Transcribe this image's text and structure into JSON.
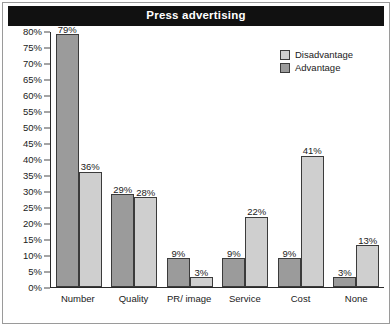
{
  "title": "Press advertising",
  "colors": {
    "advantage": "#9b9b9b",
    "disadvantage": "#cfcfcf",
    "title_bar_bg": "#111111",
    "title_text": "#ffffff",
    "axis": "#2a2a2a"
  },
  "legend": {
    "position": "top-right",
    "items": [
      {
        "label": "Disadvantage",
        "swatch": "disadvantage"
      },
      {
        "label": "Advantage",
        "swatch": "advantage"
      }
    ]
  },
  "axis": {
    "y_ticks": [
      "80%",
      "75%",
      "70%",
      "65%",
      "60%",
      "55%",
      "50%",
      "45%",
      "40%",
      "35%",
      "30%",
      "25%",
      "20%",
      "15%",
      "10%",
      "5%",
      "0%"
    ]
  },
  "chart_data": {
    "type": "bar",
    "title": "Press advertising",
    "xlabel": "",
    "ylabel": "",
    "ylim": [
      0,
      80
    ],
    "ytick_step": 5,
    "grid": false,
    "legend_position": "top-right",
    "categories": [
      "Number",
      "Quality",
      "PR/ image",
      "Service",
      "Cost",
      "None"
    ],
    "series": [
      {
        "name": "Advantage",
        "values": [
          79,
          29,
          9,
          9,
          9,
          3
        ],
        "labels": [
          "79%",
          "29%",
          "9%",
          "9%",
          "9%",
          "3%"
        ]
      },
      {
        "name": "Disadvantage",
        "values": [
          36,
          28,
          3,
          22,
          41,
          13
        ],
        "labels": [
          "36%",
          "28%",
          "3%",
          "22%",
          "41%",
          "13%"
        ]
      }
    ]
  }
}
